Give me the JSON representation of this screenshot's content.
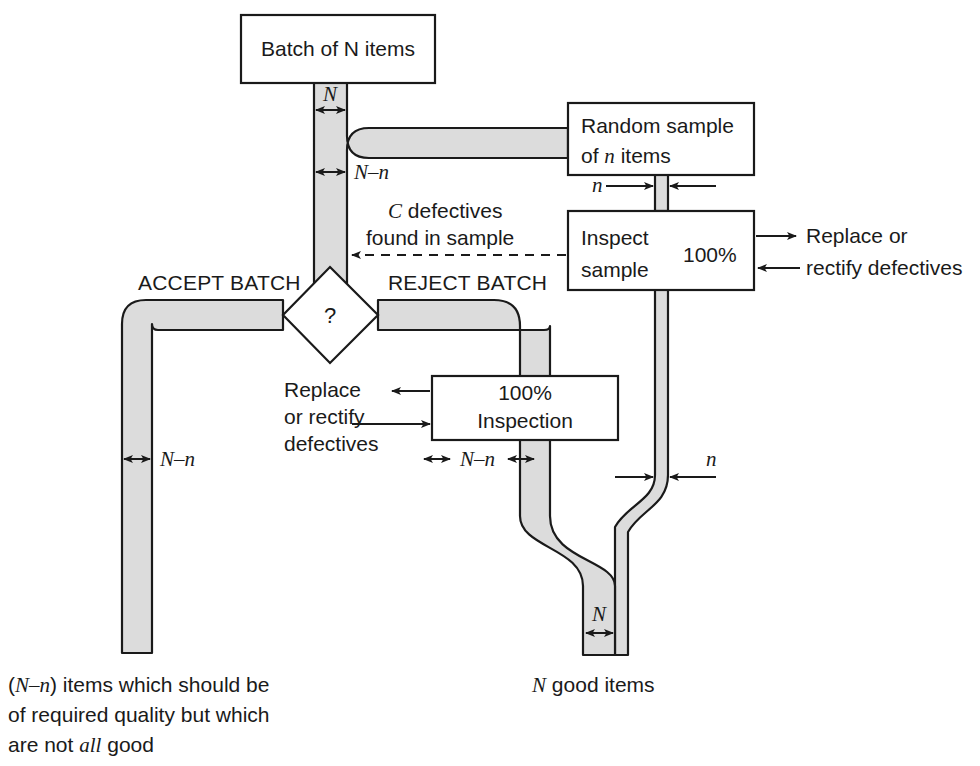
{
  "diagram": {
    "colors": {
      "pipe_fill": "#dcdcdc",
      "stroke": "#1a1a1a",
      "background": "#ffffff",
      "text": "#1a1a1a"
    },
    "boxes": [
      {
        "id": "batch",
        "label": "Batch of N items"
      },
      {
        "id": "sample",
        "label_line1": "Random sample",
        "label_line2": "of n items"
      },
      {
        "id": "inspect",
        "label_line1": "Inspect",
        "label_line2": "sample",
        "label_right": "100%"
      },
      {
        "id": "full",
        "label_line1": "100%",
        "label_line2": "Inspection"
      }
    ],
    "decision": {
      "id": "decision",
      "label": "?"
    },
    "branch_labels": {
      "accept": "ACCEPT BATCH",
      "reject": "REJECT BATCH"
    },
    "flow_labels": {
      "top_n": "N",
      "left_n_minus_n": "N–n",
      "sample_n": "n",
      "full_inspection_n_minus_n": "N–n",
      "bottom_left_n_minus_n": "N–n",
      "merge_n": "n",
      "bottom_n": "N"
    },
    "annotations": {
      "c_defectives_line1": "C defectives",
      "c_defectives_line2": "found in sample",
      "inspect_out_line1": "Replace or",
      "inspect_out_line2": "rectify defectives",
      "full_out_line1": "Replace",
      "full_out_line2": "or rectify",
      "full_out_line3": "defectives"
    },
    "captions": {
      "left_line1_a": "(",
      "left_line1_b": "N–n",
      "left_line1_c": ") items which should be",
      "left_line2": "of required quality but which",
      "left_line3_a": "are not ",
      "left_line3_b": "all",
      "left_line3_c": " good",
      "bottom_a": "N",
      "bottom_b": " good items"
    }
  }
}
